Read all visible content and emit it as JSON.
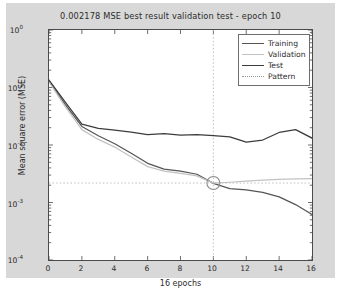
{
  "chart_data": {
    "type": "line",
    "title": "0.002178 MSE best result validation test - epoch 10",
    "xlabel": "16 epochs",
    "ylabel": "Mean square error (MSE)",
    "xlim": [
      0,
      16
    ],
    "ylim": [
      0.0001,
      1
    ],
    "yscale": "log",
    "grid": false,
    "legend_position": "top-right",
    "xticks": [
      "0",
      "2",
      "4",
      "6",
      "8",
      "10",
      "12",
      "14",
      "16"
    ],
    "xtick_values": [
      0,
      2,
      4,
      6,
      8,
      10,
      12,
      14,
      16
    ],
    "yticks": [
      "10",
      "10",
      "10",
      "10",
      "10"
    ],
    "ytick_exponents": [
      "0",
      "-1",
      "-2",
      "-3",
      "-4"
    ],
    "ytick_values": [
      1,
      0.1,
      0.01,
      0.001,
      0.0001
    ],
    "x": [
      0,
      1,
      2,
      3,
      4,
      5,
      6,
      7,
      8,
      9,
      10,
      11,
      12,
      13,
      14,
      15,
      16
    ],
    "series": [
      {
        "name": "Training",
        "color": "#555555",
        "values": [
          0.13,
          0.05,
          0.021,
          0.0145,
          0.0105,
          0.0072,
          0.0048,
          0.0038,
          0.0035,
          0.0031,
          0.00215,
          0.00175,
          0.00165,
          0.0015,
          0.00125,
          0.00092,
          0.00062
        ]
      },
      {
        "name": "Validation",
        "color": "#c2c2c2",
        "values": [
          0.125,
          0.046,
          0.0185,
          0.0125,
          0.0092,
          0.0062,
          0.0042,
          0.0035,
          0.0032,
          0.0029,
          0.002178,
          0.00225,
          0.00235,
          0.00245,
          0.00252,
          0.00258,
          0.0026
        ]
      },
      {
        "name": "Test",
        "color": "#3c3c3c",
        "values": [
          0.135,
          0.055,
          0.023,
          0.0195,
          0.0182,
          0.0168,
          0.0152,
          0.0158,
          0.0148,
          0.0152,
          0.0145,
          0.0138,
          0.0112,
          0.0122,
          0.0165,
          0.0185,
          0.0132
        ]
      },
      {
        "name": "Pattern",
        "color": "#9a9a9a",
        "style": "dotted"
      }
    ],
    "marker": {
      "name": "best-validation-marker",
      "x": 10,
      "y": 0.002178,
      "shape": "circle"
    },
    "crosshair": {
      "vertical_x": 10,
      "horizontal_y": 0.002178,
      "style": "dotted"
    }
  }
}
